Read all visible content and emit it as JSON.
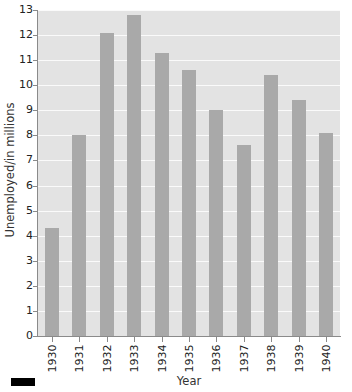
{
  "chart_data": {
    "type": "bar",
    "title": "",
    "subtitle": "",
    "xlabel": "Year",
    "ylabel": "Unemployed/in millions",
    "categories": [
      "1930",
      "1931",
      "1932",
      "1933",
      "1934",
      "1935",
      "1936",
      "1937",
      "1938",
      "1939",
      "1940"
    ],
    "values": [
      4.3,
      8.0,
      12.1,
      12.8,
      11.3,
      10.6,
      9.0,
      7.6,
      10.4,
      9.4,
      8.1
    ],
    "series": [
      {
        "name": "Unemployed",
        "values": [
          4.3,
          8.0,
          12.1,
          12.8,
          11.3,
          10.6,
          9.0,
          7.6,
          10.4,
          9.4,
          8.1
        ]
      }
    ],
    "ylim": [
      0,
      13
    ],
    "ytick_labels": [
      "0",
      "1",
      "2",
      "3",
      "4",
      "5",
      "6",
      "7",
      "8",
      "9",
      "10",
      "11",
      "12",
      "13"
    ],
    "ytick_values": [
      0,
      1,
      2,
      3,
      4,
      5,
      6,
      7,
      8,
      9,
      10,
      11,
      12,
      13
    ],
    "grid": true,
    "grid_color": "#fafafa",
    "legend_position": "none",
    "bar_color": "#a9a9a9",
    "plot_background": "#e3e3e3",
    "axis_color": "#8a8a8a"
  },
  "legend": {
    "swatch_color": "#000000"
  }
}
